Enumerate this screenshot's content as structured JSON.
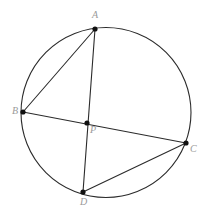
{
  "figure": {
    "kind": "circle-geometry-diagram",
    "canvas": {
      "width": 208,
      "height": 220
    },
    "colors": {
      "background": "#ffffff",
      "stroke": "#2b2b2b",
      "point_fill": "#111111",
      "label_text": "#9a9a9a"
    },
    "circle": {
      "name": "circumscribed-circle",
      "cx": 106,
      "cy": 112.5,
      "r": 85,
      "stroke_width": 1.1
    },
    "points": [
      {
        "id": "A",
        "label": "A",
        "x": 95,
        "y": 29,
        "label_x": 92,
        "label_y": 10
      },
      {
        "id": "B",
        "label": "B",
        "x": 23,
        "y": 112,
        "label_x": 12,
        "label_y": 106
      },
      {
        "id": "C",
        "label": "C",
        "x": 186,
        "y": 143,
        "label_x": 190,
        "label_y": 144
      },
      {
        "id": "D",
        "label": "D",
        "x": 83,
        "y": 192,
        "label_x": 80,
        "label_y": 197
      },
      {
        "id": "P",
        "label": "P",
        "x": 87,
        "y": 123,
        "label_x": 90,
        "label_y": 125
      }
    ],
    "segments": [
      {
        "id": "AD",
        "from": "A",
        "to": "D",
        "through": "P"
      },
      {
        "id": "BC",
        "from": "B",
        "to": "C",
        "through": "P"
      },
      {
        "id": "AB",
        "from": "A",
        "to": "B",
        "through": null
      },
      {
        "id": "CD",
        "from": "C",
        "to": "D",
        "through": null
      }
    ],
    "point_radius": 2.6
  }
}
